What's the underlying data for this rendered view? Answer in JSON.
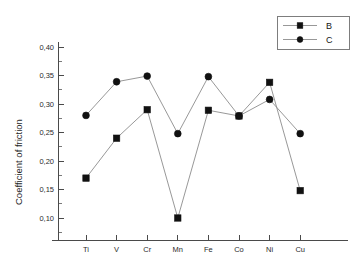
{
  "chart_data": {
    "type": "line",
    "title": "",
    "subtitle": "",
    "xlabel": "",
    "ylabel": "Coefficient of friction",
    "categories": [
      "Ti",
      "V",
      "Cr",
      "Mn",
      "Fe",
      "Co",
      "Ni",
      "Cu"
    ],
    "ylim": [
      0.075,
      0.4
    ],
    "yticks": [
      0.4,
      0.35,
      0.3,
      0.25,
      0.2,
      0.15,
      0.1
    ],
    "ytick_labels": [
      "0,40",
      "0,35",
      "0,30",
      "0,25",
      "0,20",
      "0,15",
      "0,10"
    ],
    "ytick_minor_step": 0.025,
    "grid": false,
    "legend_position": "top-right",
    "series": [
      {
        "name": "B",
        "marker": "square",
        "line_color": "#8c8c8c",
        "marker_color": "#111111",
        "values": [
          0.17,
          0.24,
          0.29,
          0.1,
          0.289,
          0.279,
          0.338,
          0.148
        ]
      },
      {
        "name": "C",
        "marker": "circle",
        "line_color": "#8c8c8c",
        "marker_color": "#111111",
        "values": [
          0.28,
          0.339,
          0.349,
          0.248,
          0.348,
          0.279,
          0.308,
          0.248
        ]
      }
    ]
  },
  "legend": {
    "entries": [
      {
        "label": "B"
      },
      {
        "label": "C"
      }
    ]
  },
  "axes": {
    "y_axis_title": "Coefficient of friction"
  }
}
